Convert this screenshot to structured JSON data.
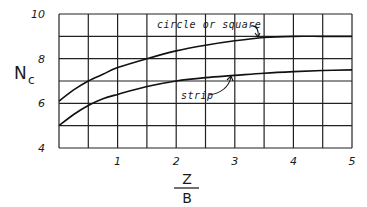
{
  "chart_data": {
    "type": "line",
    "title": "",
    "xlabel_numerator": "Z",
    "xlabel_denominator": "B",
    "xlabel": "Z/B",
    "ylabel_main": "N",
    "ylabel_sub": "c",
    "ylabel": "Nc",
    "xlim": [
      0,
      5
    ],
    "ylim": [
      4,
      10
    ],
    "x_ticks": [
      "1",
      "2",
      "3",
      "4",
      "5"
    ],
    "y_ticks": [
      "4",
      "6",
      "8",
      "10"
    ],
    "grid": true,
    "grid_x_step": 0.5,
    "grid_y_step": 1,
    "legend": "none (inline annotations)",
    "series": [
      {
        "name": "circle or square",
        "annotation": "circle or square",
        "x": [
          0,
          0.25,
          0.5,
          0.75,
          1.0,
          1.5,
          2.0,
          2.5,
          3.0,
          3.5,
          4.0,
          4.5,
          5.0
        ],
        "values": [
          6.1,
          6.6,
          7.0,
          7.3,
          7.6,
          8.0,
          8.35,
          8.6,
          8.8,
          8.95,
          9.0,
          9.0,
          9.0
        ]
      },
      {
        "name": "strip",
        "annotation": "strip",
        "x": [
          0,
          0.25,
          0.5,
          0.75,
          1.0,
          1.5,
          2.0,
          2.5,
          3.0,
          3.5,
          4.0,
          4.5,
          5.0
        ],
        "values": [
          5.0,
          5.5,
          5.9,
          6.2,
          6.4,
          6.75,
          7.0,
          7.15,
          7.25,
          7.35,
          7.42,
          7.47,
          7.5
        ]
      }
    ]
  }
}
